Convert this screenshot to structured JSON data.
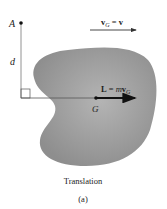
{
  "diagram": {
    "type": "rigid-body-translation",
    "labels": {
      "point_a": "A",
      "distance": "d",
      "center_of_mass": "G",
      "velocity_bold": "v",
      "velocity_sub": "G",
      "velocity_eq": " = ",
      "velocity_rhs": "v",
      "momentum_bold": "L",
      "momentum_eq": " = ",
      "momentum_m": "m",
      "momentum_v": "v",
      "momentum_sub": "G",
      "caption": "Translation",
      "sublabel": "(a)"
    },
    "colors": {
      "body_fill": "#9a9a9a",
      "line": "#555555",
      "arrow": "#111111",
      "text": "#222222"
    }
  }
}
